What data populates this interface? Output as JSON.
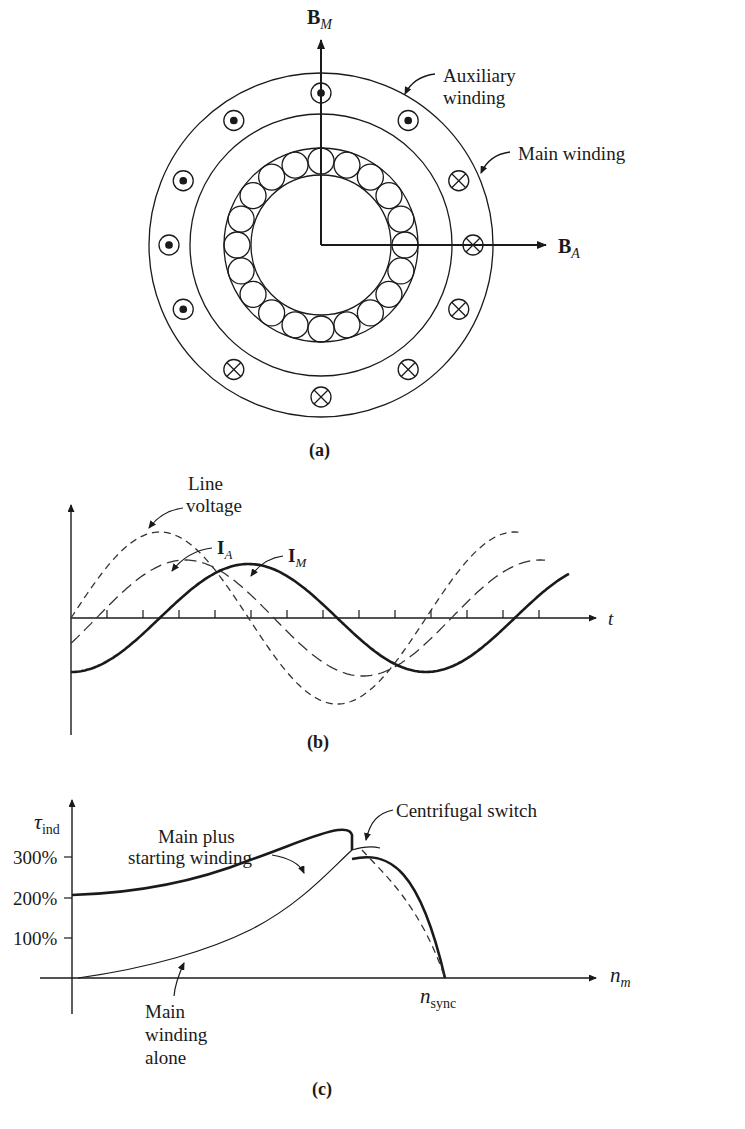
{
  "panel_a": {
    "caption": "(a)",
    "vector_bm": {
      "main": "B",
      "sub": "M"
    },
    "vector_ba": {
      "main": "B",
      "sub": "A"
    },
    "label_auxiliary_line1": "Auxiliary",
    "label_auxiliary_line2": "winding",
    "label_main": "Main winding",
    "rotor_bar_count": 20,
    "aux_dot_coils": 5,
    "aux_cross_coils": 5
  },
  "panel_b": {
    "caption": "(b)",
    "label_line_voltage_1": "Line",
    "label_line_voltage_2": "voltage",
    "label_ia": {
      "main": "I",
      "sub": "A"
    },
    "label_im": {
      "main": "I",
      "sub": "M"
    },
    "x_axis_label": "t"
  },
  "panel_c": {
    "caption": "(c)",
    "y_axis_label": {
      "main": "τ",
      "sub": "ind"
    },
    "x_axis_label": {
      "main": "n",
      "sub": "m"
    },
    "sync_label": {
      "main": "n",
      "sub": "sync"
    },
    "ticks": [
      "300%",
      "200%",
      "100%"
    ],
    "label_main_plus_1": "Main plus",
    "label_main_plus_2": "starting winding",
    "label_centrifugal": "Centrifugal switch",
    "label_main_alone_1": "Main",
    "label_main_alone_2": "winding",
    "label_main_alone_3": "alone"
  },
  "chart_data": [
    {
      "type": "line",
      "title": "(b) Currents and line voltage vs time",
      "xlabel": "t",
      "ylabel": "",
      "series": [
        {
          "name": "Line voltage",
          "style": "dashed",
          "phase_deg": 0
        },
        {
          "name": "I_A",
          "style": "long-dashed",
          "phase_deg": -30
        },
        {
          "name": "I_M",
          "style": "solid-bold",
          "phase_deg": -75
        }
      ]
    },
    {
      "type": "line",
      "title": "(c) Torque-speed characteristic",
      "xlabel": "n_m",
      "ylabel": "τ_ind",
      "y_ticks": [
        "100%",
        "200%",
        "300%"
      ],
      "x_ticks": [
        "n_sync"
      ],
      "series": [
        {
          "name": "Main plus starting winding",
          "x_frac": [
            0,
            0.2,
            0.4,
            0.6,
            0.75,
            0.8
          ],
          "y_pct": [
            135,
            150,
            190,
            250,
            320,
            330
          ]
        },
        {
          "name": "Main winding alone",
          "x_frac": [
            0,
            0.2,
            0.4,
            0.6,
            0.8,
            0.85,
            0.92,
            1.0
          ],
          "y_pct": [
            0,
            25,
            65,
            140,
            280,
            295,
            250,
            0
          ]
        }
      ],
      "annotations": [
        "Centrifugal switch"
      ]
    }
  ]
}
